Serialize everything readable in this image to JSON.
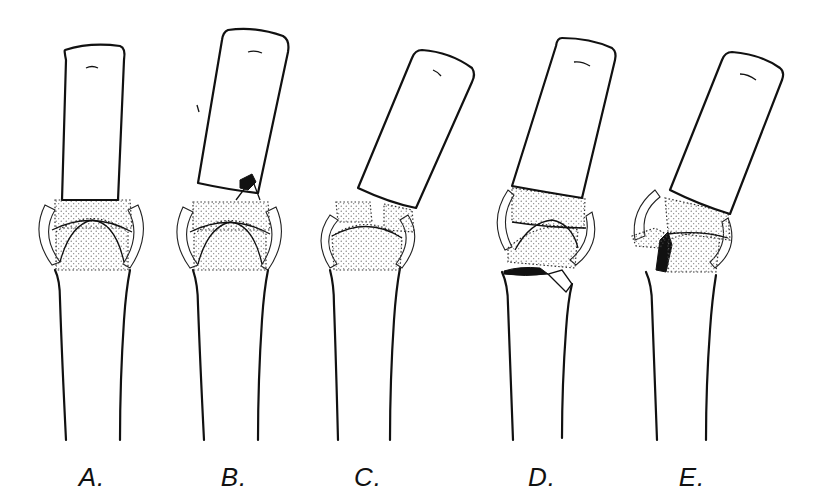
{
  "figure": {
    "panels": [
      {
        "id": "A",
        "label": "A.",
        "depiction": "normal aligned joint"
      },
      {
        "id": "B",
        "label": "B.",
        "depiction": "angulated distal bone with small avulsion fracture at base"
      },
      {
        "id": "C",
        "label": "C.",
        "depiction": "angulated distal bone with split joint surface"
      },
      {
        "id": "D",
        "label": "D.",
        "depiction": "angulation with fracture line across proximal bone head"
      },
      {
        "id": "E",
        "label": "E.",
        "depiction": "angulation with comminuted fracture fragments at joint"
      }
    ]
  }
}
